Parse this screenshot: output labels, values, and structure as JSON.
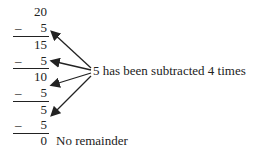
{
  "diagram": {
    "steps": [
      {
        "value": "20",
        "subtract": "5"
      },
      {
        "value": "15",
        "subtract": "5"
      },
      {
        "value": "10",
        "subtract": "5"
      },
      {
        "value": "5",
        "subtract": "5"
      }
    ],
    "minus_sign": "–",
    "final": "0",
    "final_note": "No remainder",
    "annotation": "5 has been subtracted 4 times"
  }
}
